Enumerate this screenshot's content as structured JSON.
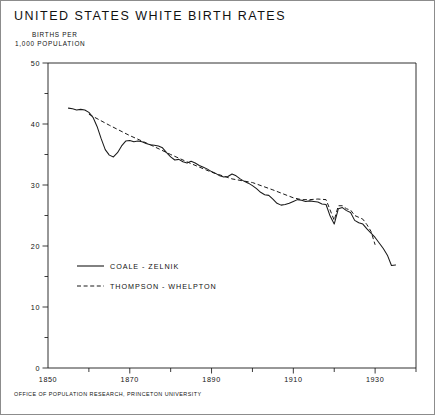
{
  "figure": {
    "title": "UNITED STATES WHITE BIRTH RATES",
    "y_axis_caption_line1": "BIRTHS PER",
    "y_axis_caption_line2": "1,000 POPULATION",
    "footer": "OFFICE OF POPULATION RESEARCH, PRINCETON UNIVERSITY",
    "ink_color": "#1a1a1a",
    "background_color": "#ffffff"
  },
  "legend": {
    "position": "inside-lower-left",
    "entries": [
      {
        "label": "COALE - ZELNIK",
        "style": "solid"
      },
      {
        "label": "THOMPSON - WHELPTON",
        "style": "dashed"
      }
    ]
  },
  "chart_data": {
    "type": "line",
    "title": "UNITED STATES WHITE BIRTH RATES",
    "xlabel": "",
    "ylabel": "BIRTHS PER 1,000 POPULATION",
    "xlim": [
      1850,
      1940
    ],
    "ylim": [
      0,
      50
    ],
    "grid": false,
    "x_major_ticks": [
      1850,
      1870,
      1890,
      1910,
      1930
    ],
    "x_major_tick_labels": [
      "1850",
      "1870",
      "1890",
      "1910",
      "1930"
    ],
    "x_minor_ticks": [
      1860,
      1880,
      1900,
      1920,
      1940
    ],
    "y_major_ticks": [
      0,
      10,
      20,
      30,
      40,
      50
    ],
    "y_major_tick_labels": [
      "0",
      "10",
      "20",
      "30",
      "40",
      "50"
    ],
    "y_minor_ticks": [
      5,
      15,
      25,
      35,
      45
    ],
    "series": [
      {
        "name": "COALE - ZELNIK",
        "style": "solid",
        "x": [
          1855,
          1856,
          1857,
          1858,
          1859,
          1860,
          1861,
          1862,
          1863,
          1864,
          1865,
          1866,
          1867,
          1868,
          1869,
          1870,
          1871,
          1872,
          1873,
          1874,
          1875,
          1876,
          1877,
          1878,
          1879,
          1880,
          1881,
          1882,
          1883,
          1884,
          1885,
          1886,
          1887,
          1888,
          1889,
          1890,
          1891,
          1892,
          1893,
          1894,
          1895,
          1896,
          1897,
          1898,
          1899,
          1900,
          1901,
          1902,
          1903,
          1904,
          1905,
          1906,
          1907,
          1908,
          1909,
          1910,
          1911,
          1912,
          1913,
          1914,
          1915,
          1916,
          1917,
          1918,
          1919,
          1920,
          1921,
          1922,
          1923,
          1924,
          1925,
          1926,
          1927,
          1928,
          1929,
          1930,
          1931,
          1932,
          1933,
          1934,
          1935
        ],
        "values": [
          42.6,
          42.5,
          42.3,
          42.4,
          42.3,
          41.9,
          41.1,
          39.6,
          37.6,
          35.8,
          34.9,
          34.6,
          35.3,
          36.4,
          37.2,
          37.3,
          37.1,
          37.2,
          37.1,
          36.8,
          36.6,
          36.5,
          36.4,
          36.1,
          35.3,
          34.6,
          34.1,
          34.2,
          33.8,
          33.6,
          33.9,
          33.6,
          33.2,
          32.9,
          32.6,
          32.2,
          31.9,
          31.5,
          31.3,
          31.4,
          31.8,
          31.5,
          31.0,
          30.6,
          30.3,
          29.9,
          29.4,
          28.8,
          28.4,
          28.3,
          27.7,
          27.0,
          26.7,
          26.8,
          27.0,
          27.3,
          27.6,
          27.5,
          27.3,
          27.4,
          27.3,
          27.2,
          26.9,
          26.8,
          24.9,
          23.6,
          26.1,
          26.3,
          25.8,
          25.5,
          24.2,
          23.8,
          23.6,
          22.8,
          22.1,
          21.4,
          20.5,
          19.6,
          18.5,
          16.8,
          16.9
        ]
      },
      {
        "name": "THOMPSON - WHELPTON",
        "style": "dashed",
        "x": [
          1860,
          1865,
          1870,
          1875,
          1880,
          1885,
          1890,
          1895,
          1900,
          1905,
          1910,
          1912,
          1914,
          1916,
          1918,
          1920,
          1921,
          1922,
          1923,
          1924,
          1925,
          1926,
          1927,
          1928,
          1929,
          1930
        ],
        "values": [
          41.6,
          39.8,
          38.1,
          36.6,
          35.0,
          33.5,
          32.1,
          31.0,
          30.4,
          29.2,
          27.9,
          27.6,
          27.6,
          27.7,
          27.6,
          24.2,
          26.6,
          26.6,
          26.1,
          25.9,
          25.0,
          24.7,
          24.4,
          23.5,
          22.4,
          20.2
        ]
      }
    ],
    "annotations": [
      {
        "text": "Civil War trough in the Coale-Zelnik series",
        "x": 1866,
        "y": 34.6
      }
    ]
  }
}
